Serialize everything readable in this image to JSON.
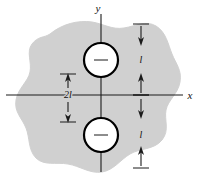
{
  "figure": {
    "colors": {
      "body_fill": "#d0d0d0",
      "body_stroke": "#d0d0d0",
      "axis": "#1a1a1a",
      "hole_fill": "#ffffff",
      "hole_stroke": "#000000",
      "dimension": "#1a1a1a",
      "background": "#ffffff"
    },
    "axes": {
      "x_label": "x",
      "y_label": "y"
    },
    "holes": [
      {
        "name": "upper-hole",
        "center_mark": "−"
      },
      {
        "name": "lower-hole",
        "center_mark": "−"
      }
    ],
    "dimensions": [
      {
        "name": "upper-offset",
        "label": "l",
        "position": "right-upper"
      },
      {
        "name": "lower-offset",
        "label": "l",
        "position": "right-lower"
      },
      {
        "name": "hole-spacing",
        "label": "2l",
        "position": "left-center"
      }
    ]
  }
}
